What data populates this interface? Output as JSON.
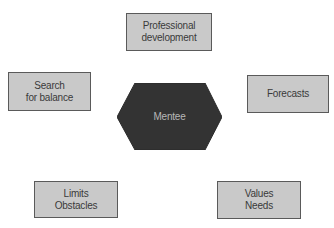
{
  "diagram": {
    "center": {
      "label": "Mentee",
      "shape": "hexagon",
      "fill": "#333333"
    },
    "nodes": [
      {
        "id": "professional-development",
        "lines": [
          "Professional",
          "development"
        ]
      },
      {
        "id": "search-for-balance",
        "lines": [
          "Search",
          "for balance"
        ]
      },
      {
        "id": "forecasts",
        "lines": [
          "Forecasts"
        ]
      },
      {
        "id": "limits-obstacles",
        "lines": [
          "Limits",
          "Obstacles"
        ]
      },
      {
        "id": "values-needs",
        "lines": [
          "Values",
          "Needs"
        ]
      }
    ],
    "colors": {
      "box_fill": "#c9c9c9",
      "box_border": "#5a5a5a",
      "box_text": "#3a3a3a",
      "hex_text": "#b8b8b8"
    }
  }
}
